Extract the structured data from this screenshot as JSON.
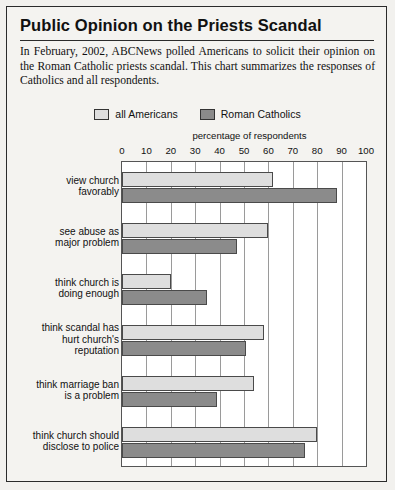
{
  "header": {
    "title": "Public Opinion on the Priests Scandal",
    "intro": "In February, 2002, ABCNews polled Americans to solicit their opinion on the Roman Catholic priests scandal. This chart summarizes the responses of Catholics and all respondents."
  },
  "legend": {
    "items": [
      {
        "label": "all Americans",
        "color": "#dedede"
      },
      {
        "label": "Roman Catholics",
        "color": "#8b8b8b"
      }
    ]
  },
  "chart_data": {
    "type": "bar",
    "orientation": "horizontal",
    "title": "Public Opinion on the Priests Scandal",
    "xlabel": "percentage of respondents",
    "ylabel": "",
    "xlim": [
      0,
      100
    ],
    "xticks": [
      0,
      10,
      20,
      30,
      40,
      50,
      60,
      70,
      80,
      90,
      100
    ],
    "grid": true,
    "legend_position": "top-center",
    "categories": [
      "view church favorably",
      "see abuse as major problem",
      "think church is doing enough",
      "think scandal has hurt church's reputation",
      "think marriage ban is a problem",
      "think church should disclose to police"
    ],
    "category_lines": [
      [
        "view church",
        "favorably"
      ],
      [
        "see abuse as",
        "major problem"
      ],
      [
        "think church is",
        "doing enough"
      ],
      [
        "think scandal has",
        "hurt church's",
        "reputation"
      ],
      [
        "think marriage ban",
        "is a problem"
      ],
      [
        "think church should",
        "disclose to police"
      ]
    ],
    "series": [
      {
        "name": "all Americans",
        "color": "#dedede",
        "values": [
          62,
          60,
          20,
          58,
          54,
          80
        ]
      },
      {
        "name": "Roman Catholics",
        "color": "#8b8b8b",
        "values": [
          88,
          47,
          35,
          51,
          39,
          75
        ]
      }
    ]
  }
}
